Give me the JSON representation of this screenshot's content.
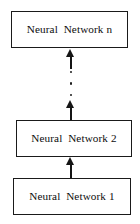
{
  "diagram": {
    "type": "flow-cascade",
    "orientation": "bottom-to-top",
    "background_color": "#ffffff",
    "stroke_color": "#1a1a1a",
    "text_color": "#0d0d0d",
    "nodes": [
      {
        "id": "nn-n",
        "label": "Neural  Network n"
      },
      {
        "id": "nn-2",
        "label": "Neural  Network 2"
      },
      {
        "id": "nn-1",
        "label": "Neural  Network 1"
      }
    ],
    "ellipsis": {
      "glyph": "vertical-ellipsis",
      "dot_count": 3
    },
    "connectors": [
      {
        "id": "arrow-to-middle",
        "from": "nn-1",
        "to": "nn-2",
        "direction": "up",
        "style": "solid-arrow"
      },
      {
        "id": "arrow-to-dots",
        "from": "nn-2",
        "to": "ellipsis",
        "direction": "up",
        "style": "solid-arrow"
      },
      {
        "id": "arrow-to-top",
        "from": "ellipsis",
        "to": "nn-n",
        "direction": "up",
        "style": "solid-arrow"
      }
    ]
  }
}
